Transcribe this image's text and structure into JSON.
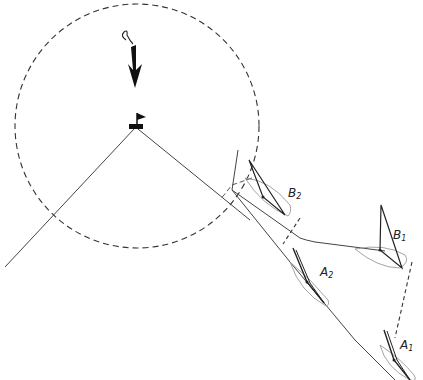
{
  "diagram": {
    "type": "sailing-rules-illustration",
    "zone": {
      "name": "three-length zone",
      "style": "dashed circle"
    },
    "wind": {
      "icon": "wind-arrow-icon",
      "direction": "down"
    },
    "mark": {
      "icon": "flagged-mark-icon"
    },
    "boats": [
      {
        "id": "B2",
        "letter": "B",
        "index": "2"
      },
      {
        "id": "B1",
        "letter": "B",
        "index": "1"
      },
      {
        "id": "A2",
        "letter": "A",
        "index": "2"
      },
      {
        "id": "A1",
        "letter": "A",
        "index": "1"
      }
    ],
    "colors": {
      "line": "#333333",
      "hull": "#aaaaaa",
      "sail": "#222222",
      "background": "#ffffff"
    }
  }
}
